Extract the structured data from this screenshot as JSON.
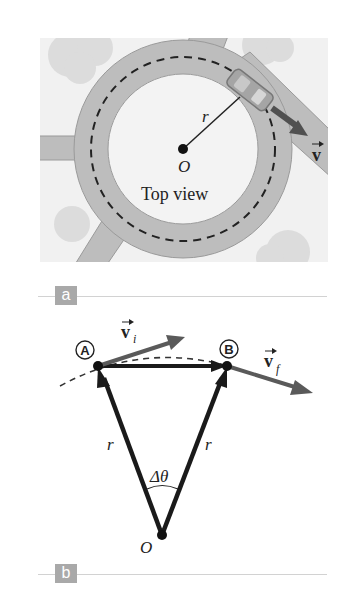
{
  "figure": {
    "panel_a": {
      "tag": "a",
      "caption_text": "Top view",
      "center_label": "O",
      "radius_label": "r",
      "velocity_label": "v",
      "colors": {
        "background": "#f1f1f1",
        "road": "#bdbdbd",
        "road_edge": "#9a9a9a",
        "bush": "#dcdcdc",
        "arrow": "#505050",
        "car": "#a5a5a5"
      }
    },
    "panel_b": {
      "tag": "b",
      "point_a_label": "A",
      "point_b_label": "B",
      "vi_label": "v",
      "vi_subscript": "i",
      "vf_label": "v",
      "vf_subscript": "f",
      "radius_left_label": "r",
      "radius_right_label": "r",
      "angle_label": "Δθ",
      "origin_label": "O",
      "colors": {
        "vector_dark": "#1a1a1a",
        "velocity_arrow": "#5a5a5a",
        "separator": "#d2d2d2",
        "tag_bg": "#a9a9a9"
      }
    }
  }
}
